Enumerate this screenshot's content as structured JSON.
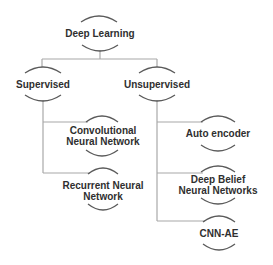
{
  "diagram": {
    "type": "tree",
    "colors": {
      "text": "#2f2f2f",
      "connector": "#a8a8a8",
      "bracket": "#5a5a5a",
      "background": "#ffffff"
    },
    "root": {
      "label": "Deep Learning"
    },
    "branches": [
      {
        "label": "Supervised",
        "children": [
          {
            "lines": [
              "Convolutional",
              "Neural Network"
            ]
          },
          {
            "lines": [
              "Recurrent Neural",
              "Network"
            ]
          }
        ]
      },
      {
        "label": "Unsupervised",
        "children": [
          {
            "lines": [
              "Auto encoder"
            ]
          },
          {
            "lines": [
              "Deep Belief",
              "Neural Networks"
            ]
          },
          {
            "lines": [
              "CNN-AE"
            ]
          }
        ]
      }
    ]
  }
}
